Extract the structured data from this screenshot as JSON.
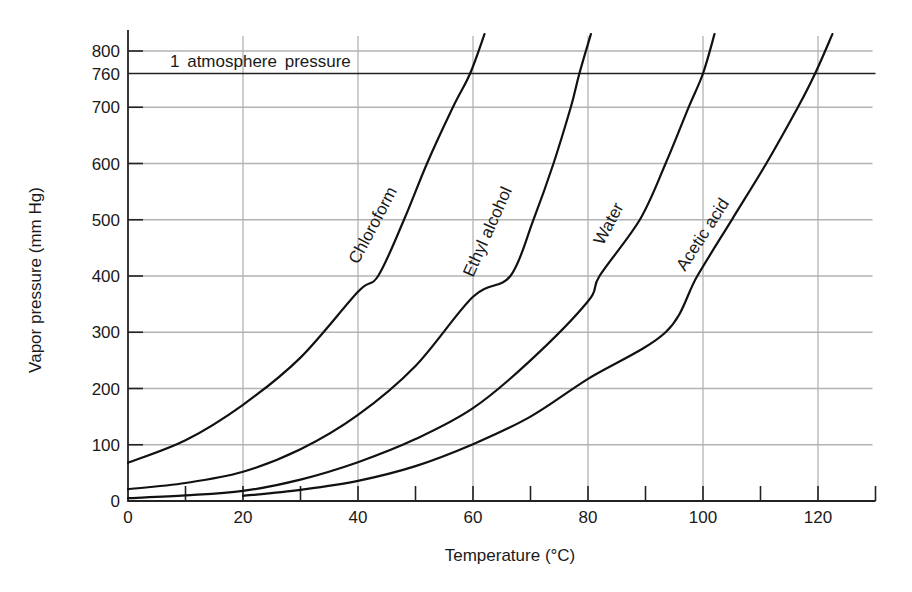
{
  "chart_data": {
    "type": "line",
    "title": "",
    "xlabel": "Temperature (°C)",
    "ylabel": "Vapor pressure (mm Hg)",
    "xlim": [
      0,
      130
    ],
    "ylim": [
      0,
      830
    ],
    "x_ticks": [
      0,
      20,
      40,
      60,
      80,
      100,
      120
    ],
    "x_minor_ticks": [
      10,
      30,
      50,
      70,
      90,
      110,
      130
    ],
    "y_ticks": [
      0,
      100,
      200,
      300,
      400,
      500,
      600,
      700,
      760,
      800
    ],
    "grid": true,
    "legend": "none (labels placed along curves)",
    "annotations": [
      {
        "text": "1 atmosphere pressure",
        "type": "horizontal-line",
        "y": 760
      }
    ],
    "series": [
      {
        "name": "Chloroform",
        "x": [
          0,
          10,
          20,
          30,
          40,
          43.5,
          48,
          52,
          56.5,
          59.5,
          62
        ],
        "y": [
          68,
          108,
          171,
          255,
          372,
          400,
          500,
          600,
          700,
          760,
          830
        ]
      },
      {
        "name": "Ethyl alcohol",
        "x": [
          0,
          10,
          20,
          30,
          40,
          50,
          60,
          66.5,
          70.5,
          74,
          77,
          78.5,
          80.5
        ],
        "y": [
          21,
          32,
          52,
          92,
          153,
          240,
          363,
          400,
          500,
          600,
          700,
          760,
          830
        ]
      },
      {
        "name": "Water",
        "x": [
          0,
          10,
          20,
          30,
          40,
          50,
          60,
          70,
          80,
          82,
          89,
          93.5,
          97.5,
          100,
          102
        ],
        "y": [
          5,
          10,
          18,
          38,
          69,
          110,
          165,
          250,
          355,
          400,
          500,
          600,
          700,
          760,
          830
        ]
      },
      {
        "name": "Acetic acid",
        "x": [
          20,
          30,
          40,
          50,
          60,
          70,
          80,
          93.5,
          99,
          105,
          111,
          116.5,
          119.5,
          122.5
        ],
        "y": [
          9,
          20,
          36,
          62,
          101,
          150,
          217,
          300,
          400,
          500,
          600,
          700,
          760,
          830
        ]
      }
    ]
  },
  "labels": {
    "x_axis_title": "Temperature (°C)",
    "y_axis_title": "Vapor pressure (mm Hg)",
    "atm_annotation": "1 atmosphere pressure",
    "curve_labels": [
      "Chloroform",
      "Ethyl alcohol",
      "Water",
      "Acetic acid"
    ]
  },
  "colors": {
    "curve": "#111111",
    "grid": "#b3b3b3",
    "axis": "#222222",
    "background": "#ffffff"
  }
}
